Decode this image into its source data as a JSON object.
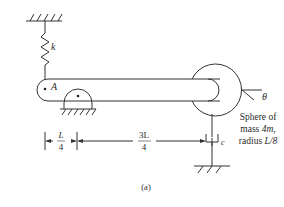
{
  "diagram": {
    "labels": {
      "spring": "k",
      "point_a": "A",
      "angle": "θ",
      "damper": "c",
      "caption": "(a)"
    },
    "sphere_text": {
      "line1": "Sphere of",
      "line2_prefix": "mass ",
      "line2_value": "4m",
      "line2_suffix": ",",
      "line3_prefix": "radius ",
      "line3_value": "L/8"
    },
    "dimensions": {
      "left": {
        "numerator": "L",
        "denominator": "4"
      },
      "right": {
        "numerator": "3L",
        "denominator": "4"
      }
    },
    "colors": {
      "stroke": "#333333",
      "text": "#2a2a2a"
    }
  }
}
